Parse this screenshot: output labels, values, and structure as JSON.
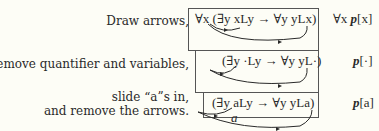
{
  "steps": [
    {
      "instruction": "Draw arrows,",
      "formula": "∀x (∃y xLy → ∀y yLx)",
      "result_prefix": "∀x ",
      "result_bold": "p",
      "result_arg": "[x]"
    },
    {
      "instruction": "remove quantifier and variables,",
      "formula": "(∃y ·Ly → ∀y yL·)",
      "result_prefix": "",
      "result_bold": "p",
      "result_arg": "[·]"
    },
    {
      "instruction_line1": "slide “a”s in,",
      "instruction_line2": "and remove the arrows.",
      "formula": "(∃y aLy → ∀y yLa)",
      "arrow_label": "a",
      "result_prefix": "",
      "result_bold": "p",
      "result_arg": "[a]"
    }
  ],
  "colors": {
    "background": "#fdfdf6",
    "ink": "#2a2a2a",
    "box_border": "#555555"
  }
}
